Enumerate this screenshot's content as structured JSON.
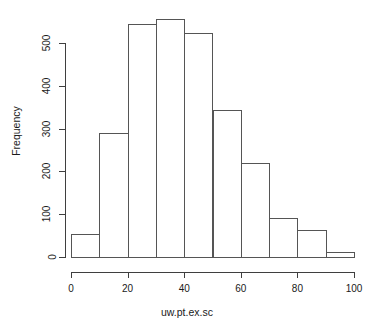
{
  "chart_data": {
    "type": "bar",
    "title": "",
    "subtitle": "",
    "xlabel": "uw.pt.ex.sc",
    "ylabel": "Frequency",
    "grid": false,
    "legend": null,
    "xlim": [
      0,
      100
    ],
    "ylim": [
      0,
      560
    ],
    "x_ticks": [
      0,
      20,
      40,
      60,
      80,
      100
    ],
    "x_tick_labels": [
      "0",
      "20",
      "40",
      "60",
      "80",
      "100"
    ],
    "y_ticks": [
      0,
      100,
      200,
      300,
      400,
      500
    ],
    "y_tick_labels": [
      "0",
      "100",
      "200",
      "300",
      "400",
      "500"
    ],
    "bin_width": 10,
    "bin_edges": [
      0,
      10,
      20,
      30,
      40,
      50,
      60,
      70,
      80,
      90,
      100
    ],
    "categories": [
      "0-10",
      "10-20",
      "20-30",
      "30-40",
      "40-50",
      "50-60",
      "60-70",
      "70-80",
      "80-90",
      "90-100"
    ],
    "values": [
      54,
      290,
      545,
      555,
      523,
      343,
      219,
      92,
      63,
      11
    ],
    "bar_fill": "#ffffff",
    "bar_stroke": "#555555",
    "axis_color": "#3f3f3f",
    "text_color": "#1a1a1a",
    "background": "#ffffff"
  }
}
